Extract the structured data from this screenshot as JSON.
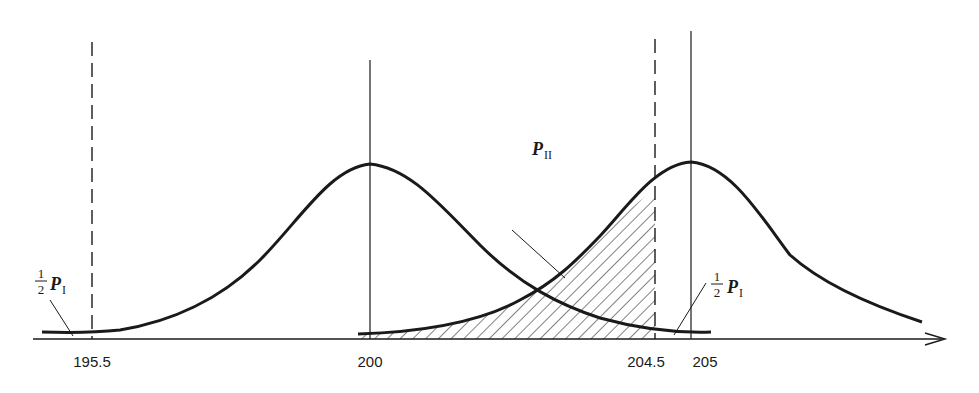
{
  "diagram": {
    "type": "hypothesis-test-distributions",
    "axis": {
      "tick_labels": [
        {
          "value": "195.5",
          "x": 92,
          "style": "dashed"
        },
        {
          "value": "200",
          "x": 370,
          "style": "solid"
        },
        {
          "value": "204.5",
          "x": 655,
          "style": "dashed"
        },
        {
          "value": "205",
          "x": 691,
          "style": "solid"
        }
      ]
    },
    "curves": [
      {
        "name": "distribution-mean-200",
        "center": "200"
      },
      {
        "name": "distribution-mean-205",
        "center": "205"
      }
    ],
    "labels": {
      "p_two_main": "P",
      "p_two_sub": "II",
      "half_num": "1",
      "half_den": "2",
      "p_one_main": "P",
      "p_one_sub": "I"
    },
    "shaded_region": "P_II (area under mean-205 curve left of 204.5)",
    "colors": {
      "ink": "#1a1a1a",
      "background": "#ffffff"
    }
  }
}
